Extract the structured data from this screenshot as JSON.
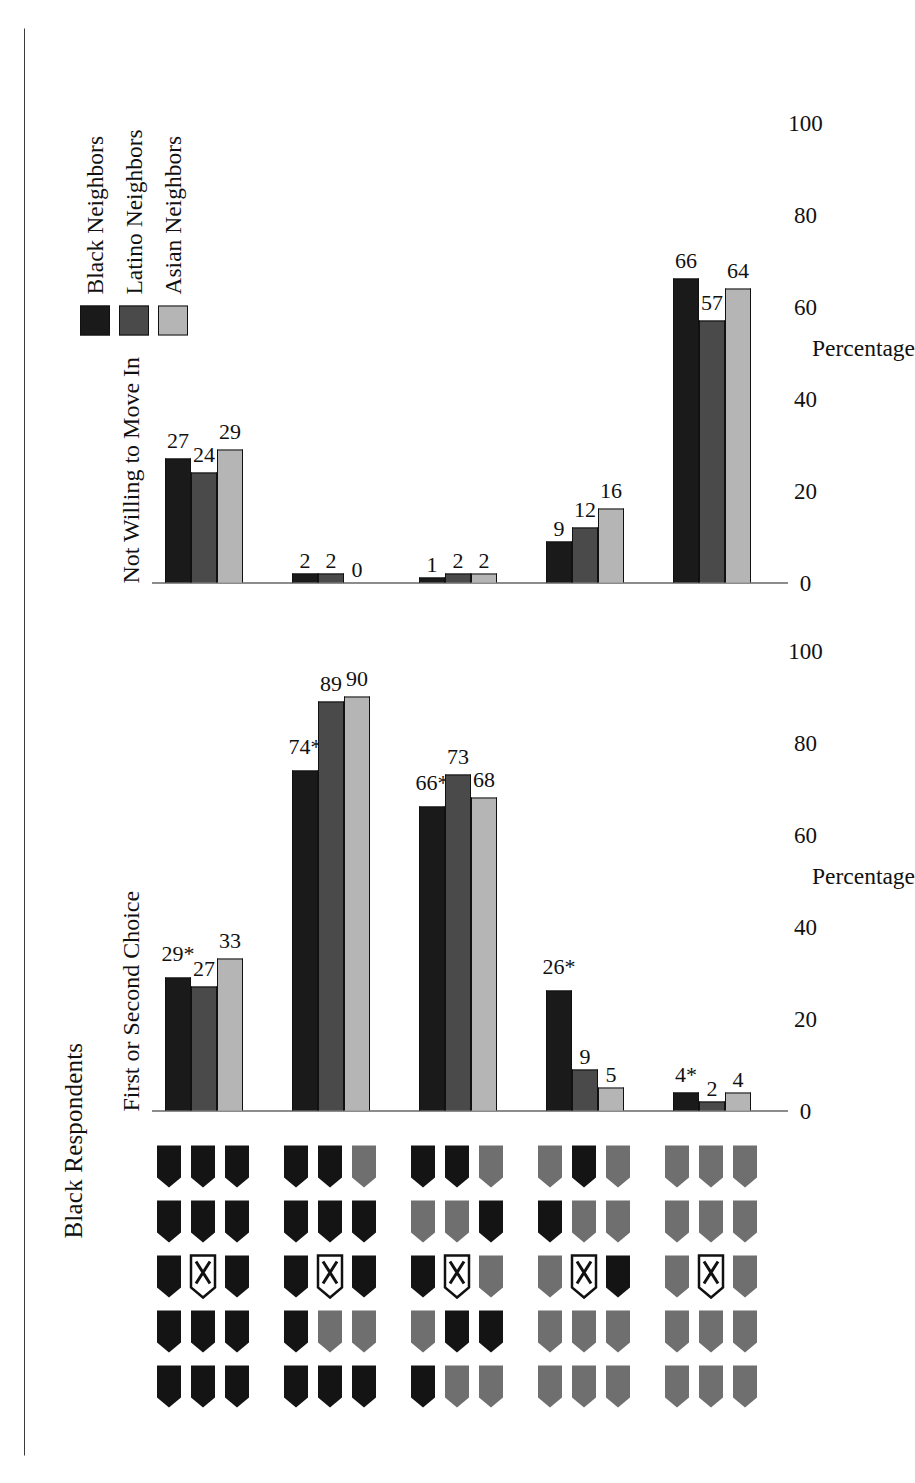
{
  "figure": {
    "title": "Black Respondents",
    "axis_caption": "Percentage"
  },
  "legend": {
    "items": [
      {
        "label": "Black Neighbors",
        "color": "#1a1a1a"
      },
      {
        "label": "Latino Neighbors",
        "color": "#4a4a4a"
      },
      {
        "label": "Asian Neighbors",
        "color": "#b5b5b5"
      }
    ]
  },
  "categories": [
    {
      "name": "all-own-race-neighborhood",
      "own": 14,
      "other": 0,
      "pattern": [
        "own",
        "own",
        "own",
        "own",
        "own",
        "own",
        "own",
        "own",
        "own",
        "own",
        "own",
        "own",
        "own",
        "own"
      ]
    },
    {
      "name": "mostly-own-race-neighborhood",
      "own": 11,
      "other": 3,
      "pattern": [
        "own",
        "own",
        "own",
        "own",
        "own",
        "own",
        "other",
        "own",
        "own",
        "own",
        "other",
        "own",
        "own",
        "other"
      ]
    },
    {
      "name": "mixed-neighborhood",
      "own": 7,
      "other": 7,
      "pattern": [
        "own",
        "other",
        "own",
        "other",
        "own",
        "other",
        "own",
        "other",
        "own",
        "other",
        "own",
        "other",
        "own",
        "other"
      ]
    },
    {
      "name": "mostly-other-race-neighborhood",
      "own": 3,
      "other": 11,
      "pattern": [
        "other",
        "other",
        "other",
        "own",
        "other",
        "other",
        "other",
        "other",
        "own",
        "other",
        "other",
        "own",
        "other",
        "other"
      ]
    },
    {
      "name": "all-other-race-neighborhood",
      "own": 0,
      "other": 14,
      "pattern": [
        "other",
        "other",
        "other",
        "other",
        "other",
        "other",
        "other",
        "other",
        "other",
        "other",
        "other",
        "other",
        "other",
        "other"
      ]
    }
  ],
  "chart_data": {
    "type": "bar",
    "title": "Black Respondents",
    "xlabel": "Percentage",
    "ylabel": "",
    "xlim": [
      0,
      100
    ],
    "xticks": [
      "0",
      "20",
      "40",
      "60",
      "80",
      "100"
    ],
    "grid": false,
    "legend_position": "top-right",
    "orientation": "horizontal",
    "series_names": [
      "Black Neighbors",
      "Latino Neighbors",
      "Asian Neighbors"
    ],
    "categories": [
      "All own-race",
      "Mostly own-race",
      "Half and half",
      "Mostly other-race",
      "All other-race"
    ],
    "panels": [
      {
        "title": "First or Second Choice",
        "series": [
          {
            "name": "Black Neighbors",
            "values": [
              29,
              74,
              66,
              26,
              4
            ],
            "labels": [
              "29*",
              "74*",
              "66*",
              "26*",
              "4*"
            ]
          },
          {
            "name": "Latino Neighbors",
            "values": [
              27,
              89,
              73,
              9,
              2
            ],
            "labels": [
              "27",
              "89",
              "73",
              "9",
              "2"
            ]
          },
          {
            "name": "Asian Neighbors",
            "values": [
              33,
              90,
              68,
              5,
              4
            ],
            "labels": [
              "33",
              "90",
              "68",
              "5",
              "4"
            ]
          }
        ]
      },
      {
        "title": "Not Willing to Move In",
        "series": [
          {
            "name": "Black Neighbors",
            "values": [
              27,
              2,
              1,
              9,
              66
            ],
            "labels": [
              "27",
              "2",
              "1",
              "9",
              "66"
            ]
          },
          {
            "name": "Latino Neighbors",
            "values": [
              24,
              2,
              2,
              12,
              57
            ],
            "labels": [
              "24",
              "2",
              "2",
              "12",
              "57"
            ]
          },
          {
            "name": "Asian Neighbors",
            "values": [
              29,
              0,
              2,
              16,
              64
            ],
            "labels": [
              "29",
              "0",
              "2",
              "16",
              "64"
            ]
          }
        ]
      }
    ]
  }
}
